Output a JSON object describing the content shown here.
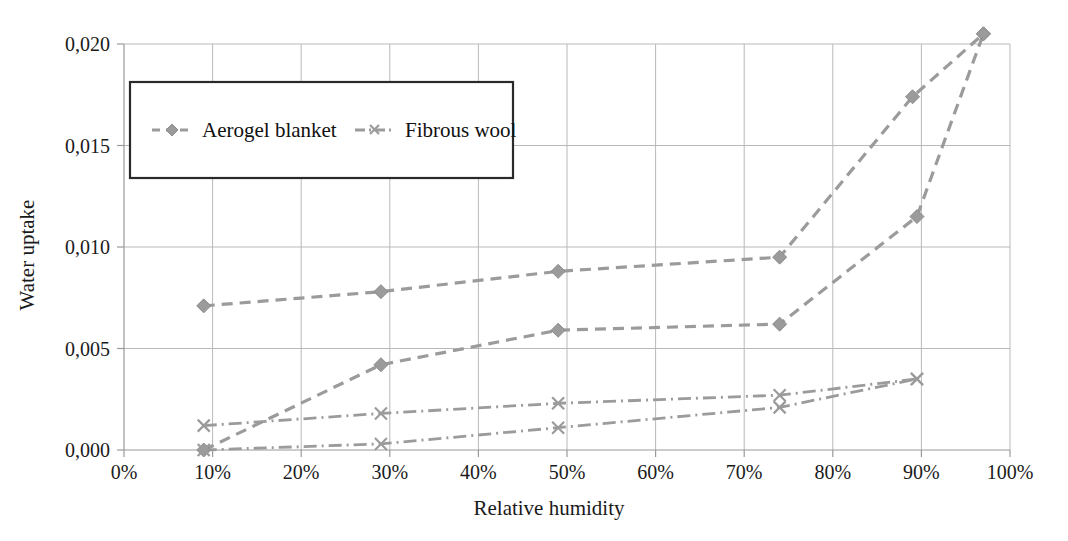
{
  "chart_data": {
    "type": "line",
    "title": "",
    "xlabel": "Relative humidity",
    "ylabel": "Water uptake",
    "xlim": [
      0,
      100
    ],
    "ylim": [
      0,
      0.0205
    ],
    "grid": true,
    "legend_position": "upper-left-inside",
    "x_tick_labels": [
      "0%",
      "10%",
      "20%",
      "30%",
      "40%",
      "50%",
      "60%",
      "70%",
      "80%",
      "90%",
      "100%"
    ],
    "x_ticks": [
      0,
      10,
      20,
      30,
      40,
      50,
      60,
      70,
      80,
      90,
      100
    ],
    "y_tick_labels": [
      "0,000",
      "0,005",
      "0,010",
      "0,015",
      "0,020"
    ],
    "y_ticks": [
      0.0,
      0.005,
      0.01,
      0.015,
      0.02
    ],
    "legend_entries": [
      {
        "label": "Aerogel blanket",
        "marker": "diamond",
        "dash": "dashed"
      },
      {
        "label": "Fibrous wool",
        "marker": "cross",
        "dash": "dash-dot"
      }
    ],
    "series": [
      {
        "name": "Aerogel blanket",
        "marker": "diamond",
        "dash": "dashed",
        "x": [
          9,
          29,
          49,
          74,
          89,
          97
        ],
        "values": [
          0.0071,
          0.0078,
          0.0088,
          0.0095,
          0.0174,
          0.0205
        ]
      },
      {
        "name": "Aerogel blanket",
        "marker": "diamond",
        "dash": "dashed",
        "x": [
          9,
          29,
          49,
          74,
          89.5,
          97
        ],
        "values": [
          0.0,
          0.0042,
          0.0059,
          0.0062,
          0.0115,
          0.0205
        ]
      },
      {
        "name": "Fibrous wool",
        "marker": "cross",
        "dash": "dash-dot",
        "x": [
          9,
          29,
          49,
          74,
          89.5
        ],
        "values": [
          0.0012,
          0.0018,
          0.0023,
          0.0027,
          0.0035
        ]
      },
      {
        "name": "Fibrous wool",
        "marker": "cross",
        "dash": "dash-dot",
        "x": [
          9,
          29,
          49,
          74,
          89.5
        ],
        "values": [
          0.0,
          0.0003,
          0.0011,
          0.0021,
          0.0035
        ]
      }
    ]
  },
  "colors": {
    "series_gray": "#9b9b9b",
    "gridline": "#b9b9b9",
    "text": "#1a1a1a",
    "legend_border": "#2a2a2a",
    "background": "#ffffff"
  }
}
